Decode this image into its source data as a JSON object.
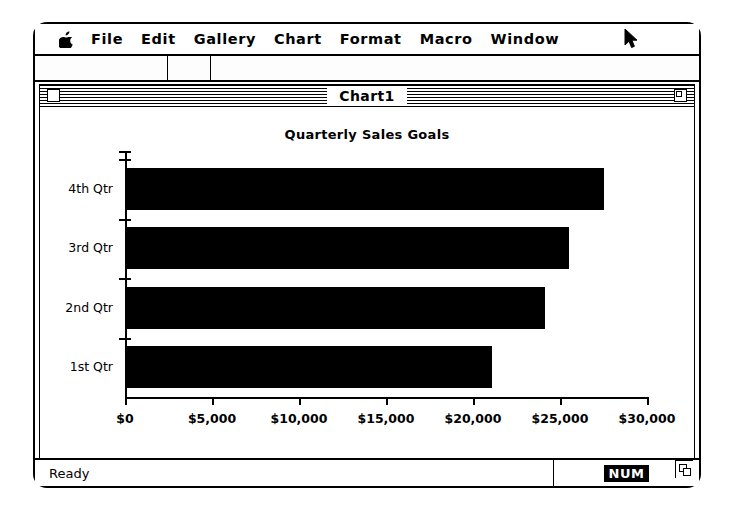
{
  "menubar": {
    "apple_icon": "apple-logo-icon",
    "items": [
      {
        "label": "File"
      },
      {
        "label": "Edit"
      },
      {
        "label": "Gallery"
      },
      {
        "label": "Chart"
      },
      {
        "label": "Format"
      },
      {
        "label": "Macro"
      },
      {
        "label": "Window"
      }
    ],
    "cursor_icon": "mouse-pointer-arrow-icon"
  },
  "window": {
    "title": "Chart1",
    "close_box_icon": "close-box-icon",
    "zoom_box_icon": "zoom-box-icon",
    "grow_box_icon": "grow-box-icon"
  },
  "statusbar": {
    "message": "Ready",
    "num_lock": "NUM"
  },
  "chart_data": {
    "type": "bar",
    "orientation": "horizontal",
    "title": "Quarterly Sales Goals",
    "xlabel": "",
    "ylabel": "",
    "categories": [
      "1st Qtr",
      "2nd Qtr",
      "3rd Qtr",
      "4th Qtr"
    ],
    "values": [
      21000,
      24000,
      25400,
      27400
    ],
    "xlim": [
      0,
      30000
    ],
    "xticks": [
      0,
      5000,
      10000,
      15000,
      20000,
      25000,
      30000
    ],
    "xticklabels": [
      "$0",
      "$5,000",
      "$10,000",
      "$15,000",
      "$20,000",
      "$25,000",
      "$30,000"
    ],
    "grid": false,
    "legend": false,
    "bar_color": "#000000",
    "background_color": "#FFFFFF"
  }
}
